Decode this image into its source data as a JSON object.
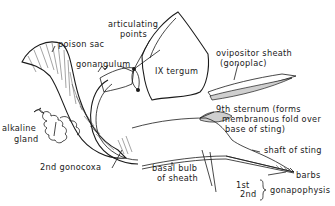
{
  "figure": {
    "labels": {
      "poison_sac": "poison sac",
      "articulating_1": "articulating",
      "articulating_2": "points",
      "gonangulum": "gonangulum",
      "ix_tergum": "IX  tergum",
      "ovipositor_1": "ovipositor  sheath",
      "ovipositor_2": "(gonoplac)",
      "alkaline_1": "alkaline",
      "alkaline_2": "gland",
      "sternum_1": "9th  sternum (forms",
      "sternum_2": "membranous  fold  over",
      "sternum_3": "base  of  sting)",
      "shaft": "shaft  of  sting",
      "gonocoxa": "2nd   gonocoxa",
      "basal_1": "basal  bulb",
      "basal_2": "of  sheath",
      "barbs": "barbs",
      "first": "1st",
      "second": "2nd",
      "gonapophysis": "gonapophysis"
    },
    "colors": {
      "ink": "#1a1a1a",
      "stipple": "#cfcfcf",
      "background": "#ffffff"
    }
  }
}
